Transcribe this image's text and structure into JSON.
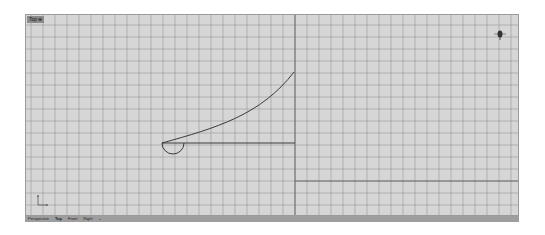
{
  "viewport": {
    "label": "Top ⊕",
    "active_view": "Top",
    "background_color": "#d6d6d6",
    "grid_color": "#8a8a8a",
    "axis_color": "#555555",
    "geometry_color": "#2a2a2a"
  },
  "tabs": [
    {
      "label": "Perspective"
    },
    {
      "label": "Top"
    },
    {
      "label": "Front"
    },
    {
      "label": "Right"
    },
    {
      "label": "+"
    }
  ],
  "icons": {
    "navigation_widget": "compass-icon",
    "axis_indicator": "xy-axis-icon"
  }
}
